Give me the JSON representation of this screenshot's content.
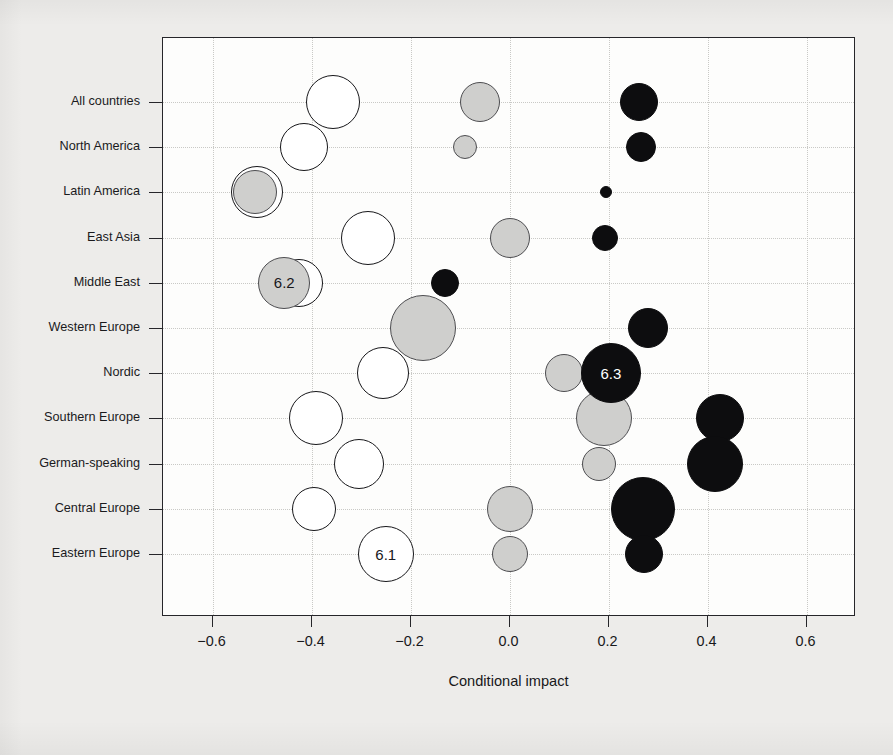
{
  "chart_data": {
    "type": "scatter",
    "title": "",
    "xlabel": "Conditional impact",
    "ylabel": "",
    "xlim": [
      -0.7,
      0.7
    ],
    "ylim": [
      0,
      12
    ],
    "grid": true,
    "legend_position": "none",
    "xticks": [
      "-0.6",
      "-0.4",
      "-0.2",
      "0.0",
      "0.2",
      "0.4",
      "0.6"
    ],
    "xtick_values": [
      -0.6,
      -0.4,
      -0.2,
      0.0,
      0.2,
      0.4,
      0.6
    ],
    "categories": [
      "All countries",
      "North America",
      "Latin America",
      "East Asia",
      "Middle East",
      "Western Europe",
      "Nordic",
      "Southern Europe",
      "German-speaking",
      "Central Europe",
      "Eastern Europe"
    ],
    "series": [
      {
        "name": "white",
        "fill": "#ffffff",
        "points": [
          {
            "category": "All countries",
            "x": -0.357,
            "r": 27,
            "label": ""
          },
          {
            "category": "North America",
            "x": -0.415,
            "r": 24,
            "label": ""
          },
          {
            "category": "Latin America",
            "x": -0.51,
            "r": 26,
            "label": ""
          },
          {
            "category": "East Asia",
            "x": -0.285,
            "r": 27,
            "label": ""
          },
          {
            "category": "Middle East",
            "x": -0.425,
            "r": 24,
            "label": "",
            "value": "6.2"
          },
          {
            "category": "Nordic",
            "x": -0.255,
            "r": 26,
            "label": ""
          },
          {
            "category": "Southern Europe",
            "x": -0.39,
            "r": 27,
            "label": ""
          },
          {
            "category": "German-speaking",
            "x": -0.305,
            "r": 25,
            "label": ""
          },
          {
            "category": "Central Europe",
            "x": -0.395,
            "r": 22,
            "label": ""
          },
          {
            "category": "Eastern Europe",
            "x": -0.25,
            "r": 28,
            "label": "6.1"
          }
        ]
      },
      {
        "name": "gray",
        "fill": "#cfcfcd",
        "points": [
          {
            "category": "All countries",
            "x": -0.06,
            "r": 20,
            "label": ""
          },
          {
            "category": "North America",
            "x": -0.09,
            "r": 12,
            "label": ""
          },
          {
            "category": "Latin America",
            "x": -0.515,
            "r": 22,
            "label": ""
          },
          {
            "category": "East Asia",
            "x": 0.0,
            "r": 20,
            "label": ""
          },
          {
            "category": "Middle East",
            "x": -0.455,
            "r": 26,
            "label": "6.2"
          },
          {
            "category": "Western Europe",
            "x": -0.175,
            "r": 33,
            "label": ""
          },
          {
            "category": "Nordic",
            "x": 0.11,
            "r": 19,
            "label": ""
          },
          {
            "category": "Southern Europe",
            "x": 0.19,
            "r": 28,
            "label": ""
          },
          {
            "category": "German-speaking",
            "x": 0.18,
            "r": 17,
            "label": ""
          },
          {
            "category": "Central Europe",
            "x": 0.0,
            "r": 23,
            "label": ""
          },
          {
            "category": "Eastern Europe",
            "x": 0.0,
            "r": 18,
            "label": ""
          }
        ]
      },
      {
        "name": "black",
        "fill": "#0d0d0f",
        "points": [
          {
            "category": "All countries",
            "x": 0.262,
            "r": 19,
            "label": ""
          },
          {
            "category": "North America",
            "x": 0.265,
            "r": 15,
            "label": ""
          },
          {
            "category": "Latin America",
            "x": 0.195,
            "r": 6,
            "label": ""
          },
          {
            "category": "East Asia",
            "x": 0.192,
            "r": 13,
            "label": ""
          },
          {
            "category": "Middle East",
            "x": -0.13,
            "r": 14,
            "label": ""
          },
          {
            "category": "Western Europe",
            "x": 0.28,
            "r": 20,
            "label": ""
          },
          {
            "category": "Nordic",
            "x": 0.205,
            "r": 30,
            "label": "6.3"
          },
          {
            "category": "Southern Europe",
            "x": 0.425,
            "r": 24,
            "label": ""
          },
          {
            "category": "German-speaking",
            "x": 0.415,
            "r": 28,
            "label": ""
          },
          {
            "category": "Central Europe",
            "x": 0.27,
            "r": 32,
            "label": ""
          },
          {
            "category": "Eastern Europe",
            "x": 0.272,
            "r": 19,
            "label": ""
          }
        ]
      }
    ],
    "annotations": [
      {
        "text": "6.1",
        "category": "Eastern Europe",
        "x": -0.25,
        "color": "#18181b"
      },
      {
        "text": "6.2",
        "category": "Middle East",
        "x": -0.455,
        "color": "#18181b"
      },
      {
        "text": "6.3",
        "category": "Nordic",
        "x": 0.205,
        "color": "#ffffff"
      }
    ]
  },
  "axis": {
    "x_title": "Conditional impact"
  }
}
